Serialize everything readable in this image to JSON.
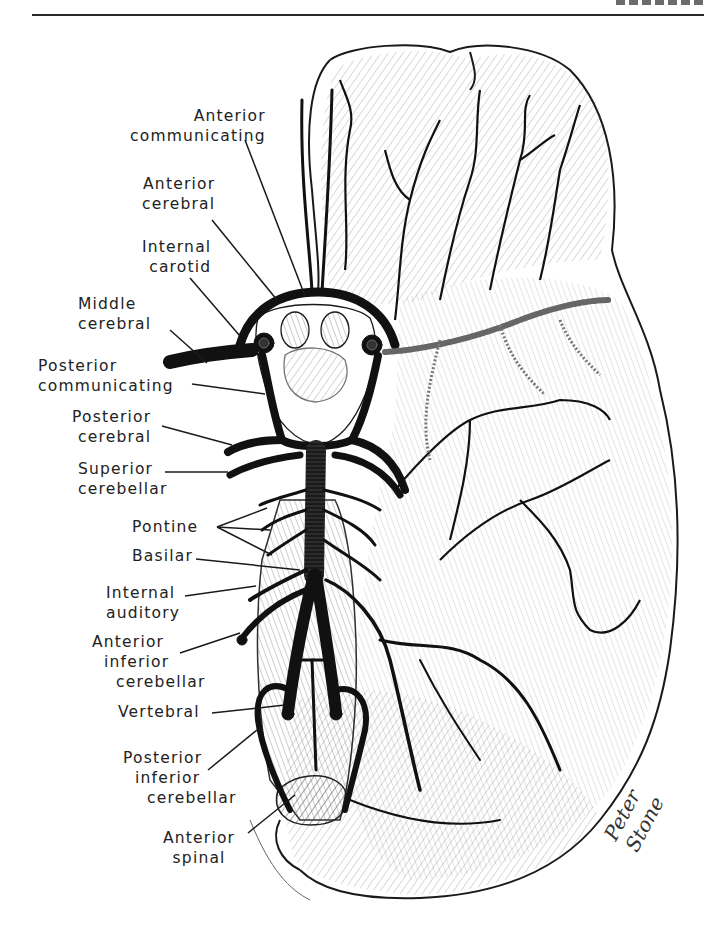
{
  "header": {
    "rule_visible": true,
    "cropped_title_fragment": true
  },
  "figure": {
    "line_color": "#1a1a1a",
    "background": "#ffffff",
    "labels": [
      {
        "id": "anterior-communicating",
        "lines": [
          "Anterior",
          "communicating"
        ]
      },
      {
        "id": "anterior-cerebral",
        "lines": [
          "Anterior",
          "cerebral"
        ]
      },
      {
        "id": "internal-carotid",
        "lines": [
          "Internal",
          "carotid"
        ]
      },
      {
        "id": "middle-cerebral",
        "lines": [
          "Middle",
          "cerebral"
        ]
      },
      {
        "id": "posterior-communicating",
        "lines": [
          "Posterior",
          "communicating"
        ]
      },
      {
        "id": "posterior-cerebral",
        "lines": [
          "Posterior",
          "cerebral"
        ]
      },
      {
        "id": "superior-cerebellar",
        "lines": [
          "Superior",
          "cerebellar"
        ]
      },
      {
        "id": "pontine",
        "lines": [
          "Pontine"
        ]
      },
      {
        "id": "basilar",
        "lines": [
          "Basilar"
        ]
      },
      {
        "id": "internal-auditory",
        "lines": [
          "Internal",
          "auditory"
        ]
      },
      {
        "id": "anterior-inferior-cerebellar",
        "lines": [
          "Anterior",
          "inferior",
          "cerebellar"
        ]
      },
      {
        "id": "vertebral",
        "lines": [
          "Vertebral"
        ]
      },
      {
        "id": "posterior-inferior-cerebellar",
        "lines": [
          "Posterior",
          "inferior",
          "cerebellar"
        ]
      },
      {
        "id": "anterior-spinal",
        "lines": [
          "Anterior",
          "spinal"
        ]
      }
    ],
    "signature": "Peter Stone"
  }
}
